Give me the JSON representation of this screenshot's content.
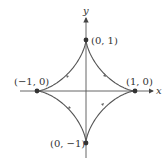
{
  "diagram": {
    "type": "parametric-curve",
    "curve": "astroid",
    "axes": {
      "x_label": "x",
      "y_label": "y"
    },
    "points": [
      {
        "label": "(0, 1)",
        "x": 0,
        "y": 1
      },
      {
        "label": "(−1, 0)",
        "x": -1,
        "y": 0
      },
      {
        "label": "(1, 0)",
        "x": 1,
        "y": 0
      },
      {
        "label": "(0, −1)",
        "x": 0,
        "y": -1
      }
    ],
    "colors": {
      "curve": "#555555",
      "axis": "#555555",
      "point": "#333333"
    }
  }
}
